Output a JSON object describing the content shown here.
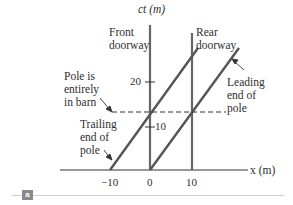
{
  "figure": {
    "panel_label": "a",
    "axes": {
      "y_label": "ct (m)",
      "x_label": "x (m)",
      "x_ticks": [
        "−10",
        "0",
        "10"
      ],
      "y_ticks": [
        "10",
        "20"
      ]
    },
    "annotations": {
      "front_doorway": "Front\ndoorway",
      "rear_doorway": "Rear\ndoorway",
      "pole_in_barn": "Pole is\nentirely\nin barn",
      "trailing_end": "Trailing\nend of\npole",
      "leading_end": "Leading\nend of\npole"
    },
    "colors": {
      "line": "#555555",
      "text": "#2e2e2e",
      "badge": "#8a8a8a"
    }
  }
}
